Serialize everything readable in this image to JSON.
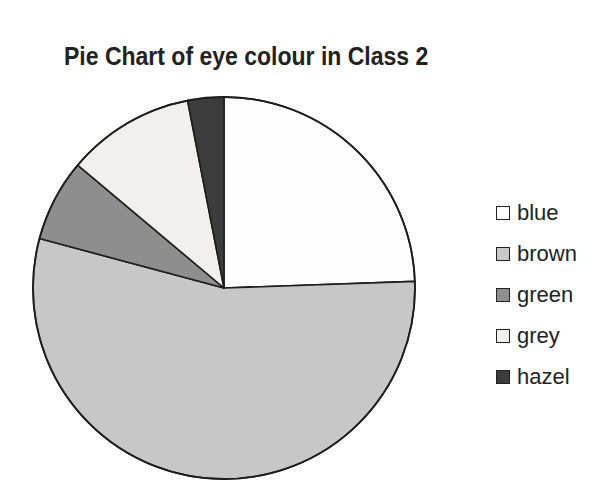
{
  "title": "Pie Chart of eye colour in Class 2",
  "chart_data": {
    "type": "pie",
    "title": "Pie Chart of eye colour in Class 2",
    "start_angle_deg": 0,
    "direction": "clockwise",
    "legend_position": "right",
    "outline_color": "#1d1d1d",
    "background_color": "#ffffff",
    "slices": [
      {
        "label": "blue",
        "color": "#fefefe",
        "angle_deg": 88,
        "percent": 24.4
      },
      {
        "label": "brown",
        "color": "#c7c7c7",
        "angle_deg": 197,
        "percent": 54.7
      },
      {
        "label": "green",
        "color": "#8e8e8e",
        "angle_deg": 25,
        "percent": 6.9
      },
      {
        "label": "grey",
        "color": "#f1f0ed",
        "angle_deg": 39,
        "percent": 10.8
      },
      {
        "label": "hazel",
        "color": "#3d3c3c",
        "angle_deg": 11,
        "percent": 3.1
      }
    ]
  }
}
